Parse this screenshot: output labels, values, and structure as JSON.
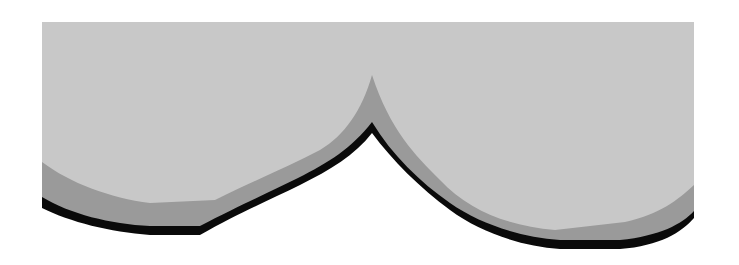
{
  "diagram": {
    "colors": {
      "background": "#ffffff",
      "top_fill": "#c8c8c8",
      "band_fill": "#9a9a9a",
      "outline": "#0a0a0a"
    },
    "bounds": {
      "left": 42,
      "top": 22,
      "right": 694
    },
    "cusp": {
      "x": 372,
      "top_y": 75,
      "outline_y": 133
    }
  }
}
